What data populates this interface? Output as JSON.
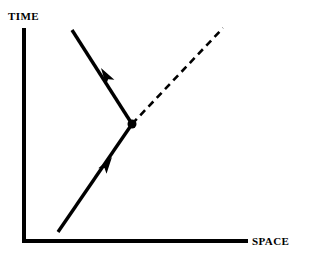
{
  "figure": {
    "kind": "spacetime-diagram",
    "background_color": "#ffffff",
    "ink_color": "#000000",
    "width": 309,
    "height": 264
  },
  "axes": {
    "time": {
      "label": "TIME",
      "orientation": "vertical",
      "x": 24,
      "y_top": 28,
      "y_bottom": 242,
      "stroke_width": 4,
      "label_x": 8,
      "label_y": 11
    },
    "space": {
      "label": "SPACE",
      "orientation": "horizontal",
      "y": 241,
      "x_left": 22,
      "x_right": 248,
      "stroke_width": 4,
      "label_x": 252,
      "label_y": 236
    }
  },
  "vertex": {
    "name": "interaction-vertex",
    "x": 132,
    "y": 124,
    "radius": 4.5,
    "color": "#000000"
  },
  "worldlines": [
    {
      "name": "incoming-worldline",
      "style": "solid",
      "stroke_width": 3.4,
      "x1": 58,
      "y1": 232,
      "x2": 132,
      "y2": 124,
      "arrow": {
        "name": "incoming-arrowhead",
        "tip_x": 112,
        "tip_y": 157,
        "direction": "up-right",
        "length": 17,
        "half_width": 5
      }
    },
    {
      "name": "outgoing-worldline",
      "style": "solid",
      "stroke_width": 3.4,
      "x1": 132,
      "y1": 124,
      "x2": 72,
      "y2": 30,
      "arrow": {
        "name": "outgoing-arrowhead",
        "tip_x": 101,
        "tip_y": 68,
        "direction": "up-left",
        "length": 17,
        "half_width": 5
      }
    },
    {
      "name": "emitted-dashed-worldline",
      "style": "dashed",
      "stroke_width": 2.6,
      "dash_pattern": "7 5",
      "x1": 132,
      "y1": 124,
      "x2": 223,
      "y2": 28,
      "arrow": null
    }
  ],
  "chart_data": {
    "type": "line",
    "title": "",
    "xlabel": "SPACE",
    "ylabel": "TIME",
    "grid": false,
    "legend": "none",
    "annotations": [
      {
        "label": "interaction vertex",
        "x": 132,
        "y": 124
      }
    ],
    "series": [
      {
        "name": "incoming particle worldline",
        "style": "solid",
        "arrow_direction": "up-right",
        "points": [
          [
            58,
            232
          ],
          [
            132,
            124
          ]
        ]
      },
      {
        "name": "outgoing particle worldline",
        "style": "solid",
        "arrow_direction": "up-left",
        "points": [
          [
            132,
            124
          ],
          [
            72,
            30
          ]
        ]
      },
      {
        "name": "emitted quantum worldline",
        "style": "dashed",
        "arrow_direction": "none",
        "points": [
          [
            132,
            124
          ],
          [
            223,
            28
          ]
        ]
      }
    ]
  }
}
